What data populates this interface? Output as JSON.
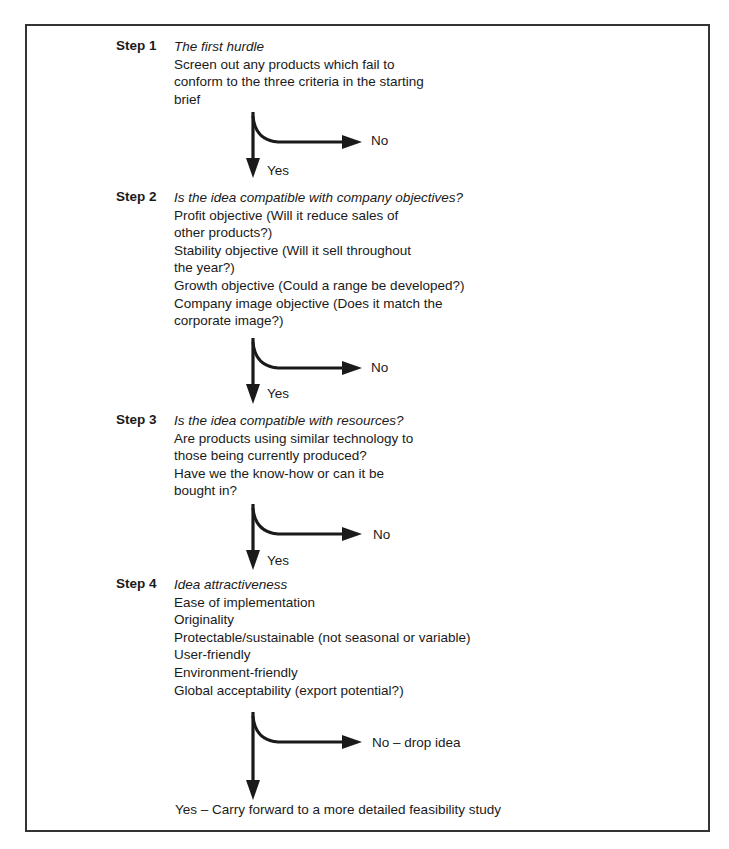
{
  "diagram": {
    "type": "flowchart",
    "steps": [
      {
        "label": "Step 1",
        "title": "The first hurdle",
        "lines": [
          "Screen out any products which fail to",
          "conform to the three criteria in the starting",
          "brief"
        ],
        "no_label": "No",
        "yes_label": "Yes"
      },
      {
        "label": "Step 2",
        "title": "Is the idea compatible with company objectives?",
        "lines": [
          "Profit objective (Will it reduce sales of",
          "other products?)",
          "Stability objective (Will it sell throughout",
          "the year?)",
          "Growth objective (Could a range be developed?)",
          "Company image objective (Does it match the",
          "corporate image?)"
        ],
        "no_label": "No",
        "yes_label": "Yes"
      },
      {
        "label": "Step 3",
        "title": "Is the idea compatible with resources?",
        "lines": [
          "Are products using similar technology to",
          "those being currently produced?",
          "Have we the know-how or can it be",
          "bought in?"
        ],
        "no_label": "No",
        "yes_label": "Yes"
      },
      {
        "label": "Step 4",
        "title": "Idea attractiveness",
        "lines": [
          "Ease of implementation",
          "Originality",
          "Protectable/sustainable (not seasonal or variable)",
          "User-friendly",
          "Environment-friendly",
          "Global acceptability (export potential?)"
        ],
        "no_label": "No – drop idea",
        "yes_label": "Yes – Carry forward to a more detailed feasibility study"
      }
    ],
    "colors": {
      "ink": "#1a1a1a",
      "frame": "#333333",
      "background": "#ffffff"
    }
  }
}
